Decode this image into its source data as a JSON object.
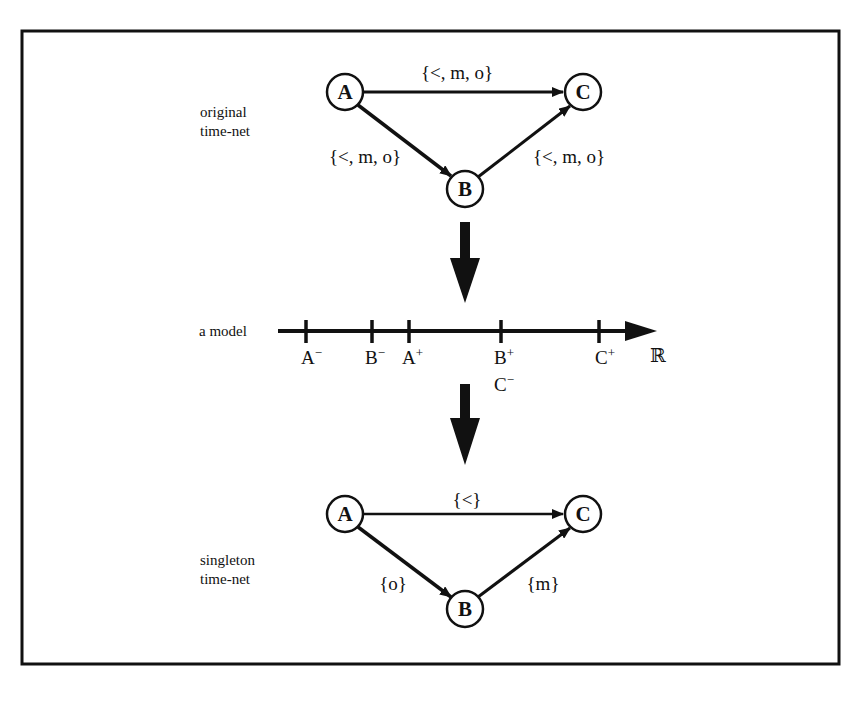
{
  "frame": {
    "border_color": "#111111",
    "background": "#ffffff"
  },
  "top_graph": {
    "side_label_line1": "original",
    "side_label_line2": "time-net",
    "nodes": {
      "A": "A",
      "B": "B",
      "C": "C"
    },
    "edges": {
      "A_C": "{<, m, o}",
      "A_B": "{<, m, o}",
      "B_C": "{<, m, o}"
    }
  },
  "model": {
    "label": "a model",
    "axis_symbol": "ℝ",
    "ticks": [
      {
        "letter": "A",
        "sign": "−"
      },
      {
        "letter": "B",
        "sign": "−"
      },
      {
        "letter": "A",
        "sign": "+"
      },
      {
        "letter": "B",
        "sign": "+",
        "second_letter": "C",
        "second_sign": "−"
      },
      {
        "letter": "C",
        "sign": "+"
      }
    ]
  },
  "bottom_graph": {
    "side_label_line1": "singleton",
    "side_label_line2": "time-net",
    "nodes": {
      "A": "A",
      "B": "B",
      "C": "C"
    },
    "edges": {
      "A_C": "{<}",
      "A_B": "{o}",
      "B_C": "{m}"
    }
  }
}
